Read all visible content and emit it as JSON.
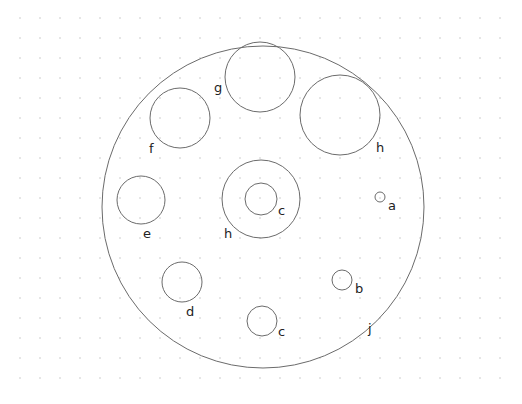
{
  "grid": {
    "x0": 20,
    "y0": 18,
    "step": 20,
    "cols": 25,
    "rows": 19,
    "dot_color": "#9a9a9a"
  },
  "stroke_color": "#6b6b6b",
  "circles": [
    {
      "id": "j",
      "cx": 263,
      "cy": 207,
      "r": 161,
      "label": "j",
      "lx": 368,
      "ly": 333
    },
    {
      "id": "g",
      "cx": 260,
      "cy": 77,
      "r": 35,
      "label": "g",
      "lx": 214,
      "ly": 92
    },
    {
      "id": "f",
      "cx": 180,
      "cy": 118,
      "r": 30,
      "label": "f",
      "lx": 149,
      "ly": 153
    },
    {
      "id": "h-top",
      "cx": 340,
      "cy": 115,
      "r": 40,
      "label": "h",
      "lx": 376,
      "ly": 152
    },
    {
      "id": "h-center",
      "cx": 261,
      "cy": 199,
      "r": 39,
      "label": "h",
      "lx": 224,
      "ly": 238
    },
    {
      "id": "c-center",
      "cx": 261,
      "cy": 199,
      "r": 16,
      "label": "c",
      "lx": 278,
      "ly": 215
    },
    {
      "id": "e",
      "cx": 141,
      "cy": 200,
      "r": 24,
      "label": "e",
      "lx": 143,
      "ly": 238
    },
    {
      "id": "a",
      "cx": 380,
      "cy": 197,
      "r": 5,
      "label": "a",
      "lx": 388,
      "ly": 210
    },
    {
      "id": "b",
      "cx": 342,
      "cy": 280,
      "r": 10,
      "label": "b",
      "lx": 355,
      "ly": 293
    },
    {
      "id": "d",
      "cx": 182,
      "cy": 282,
      "r": 20,
      "label": "d",
      "lx": 186,
      "ly": 316
    },
    {
      "id": "c-bottom",
      "cx": 262,
      "cy": 321,
      "r": 15,
      "label": "c",
      "lx": 278,
      "ly": 336
    }
  ]
}
